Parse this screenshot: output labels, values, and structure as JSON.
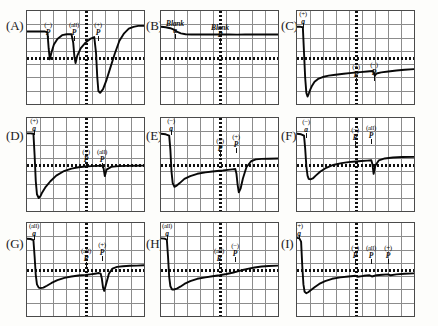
{
  "figure": {
    "title": "",
    "panel_count": 9,
    "grid_rows": 3,
    "grid_cols": 3
  },
  "chart_data": {
    "type": "line",
    "title": "",
    "xlabel": "",
    "ylabel": "",
    "grid": true,
    "legend_position": "none",
    "axis_note": "Each panel is an oscilloscope-style recording with a 9x7 graticule, a dotted horizontal baseline at mid-height and a dotted vertical marker at mid-width.",
    "panels": [
      {
        "id": "A",
        "letter": "(A)",
        "events": [
          {
            "label_top": "(−)",
            "label_bottom": "P",
            "x_frac": 0.18,
            "y_frac": 0.12,
            "kind": "pulse-down"
          },
          {
            "label_top": "(all)",
            "label_bottom": "P",
            "x_frac": 0.4,
            "y_frac": 0.12,
            "kind": "pulse-down"
          },
          {
            "label_top": "(+)",
            "label_bottom": "P",
            "x_frac": 0.61,
            "y_frac": 0.12,
            "kind": "large-deflection"
          }
        ],
        "x": [
          0.0,
          0.05,
          0.1,
          0.15,
          0.175,
          0.185,
          0.195,
          0.21,
          0.23,
          0.26,
          0.3,
          0.34,
          0.38,
          0.395,
          0.405,
          0.415,
          0.43,
          0.46,
          0.5,
          0.54,
          0.575,
          0.59,
          0.6,
          0.61,
          0.625,
          0.65,
          0.68,
          0.71,
          0.75,
          0.79,
          0.83,
          0.87,
          0.91,
          0.95,
          1.0
        ],
        "y": [
          0.22,
          0.22,
          0.22,
          0.22,
          0.23,
          0.4,
          0.52,
          0.44,
          0.36,
          0.3,
          0.26,
          0.25,
          0.25,
          0.34,
          0.49,
          0.56,
          0.48,
          0.4,
          0.34,
          0.3,
          0.28,
          0.45,
          0.7,
          0.86,
          0.88,
          0.84,
          0.74,
          0.62,
          0.46,
          0.32,
          0.24,
          0.19,
          0.17,
          0.16,
          0.16
        ],
        "baseline_frac": 0.5
      },
      {
        "id": "B",
        "letter": "(B)",
        "events": [
          {
            "label_top": "Blank",
            "label_bottom": "a",
            "x_frac": 0.12,
            "y_frac": 0.1,
            "kind": "blank"
          },
          {
            "label_top": "Blank",
            "label_bottom": "P",
            "x_frac": 0.5,
            "y_frac": 0.14,
            "kind": "blank"
          }
        ],
        "x": [
          0.0,
          0.04,
          0.08,
          0.11,
          0.14,
          0.17,
          0.21,
          0.26,
          0.33,
          0.41,
          0.5,
          0.58,
          0.65,
          0.72,
          0.79,
          0.86,
          0.93,
          1.0
        ],
        "y": [
          0.17,
          0.175,
          0.185,
          0.2,
          0.225,
          0.24,
          0.25,
          0.252,
          0.253,
          0.252,
          0.253,
          0.252,
          0.254,
          0.252,
          0.253,
          0.252,
          0.253,
          0.252
        ],
        "baseline_frac": 0.5
      },
      {
        "id": "C",
        "letter": "(C)",
        "events": [
          {
            "label_top": "(+)",
            "label_bottom": "a",
            "x_frac": 0.055,
            "y_frac": -0.02,
            "kind": "pulse-down-large"
          },
          {
            "label_top": "(+)",
            "label_bottom": "P",
            "x_frac": 0.5,
            "y_frac": 0.565,
            "kind": "small-step"
          },
          {
            "label_top": "(−)",
            "label_bottom": "P",
            "x_frac": 0.655,
            "y_frac": 0.545,
            "kind": "small-notch"
          }
        ],
        "x": [
          0.0,
          0.03,
          0.05,
          0.06,
          0.07,
          0.08,
          0.09,
          0.1,
          0.115,
          0.13,
          0.15,
          0.18,
          0.22,
          0.27,
          0.33,
          0.4,
          0.47,
          0.5,
          0.54,
          0.6,
          0.645,
          0.655,
          0.665,
          0.68,
          0.72,
          0.78,
          0.85,
          0.92,
          1.0
        ],
        "y": [
          0.17,
          0.17,
          0.175,
          0.45,
          0.72,
          0.88,
          0.92,
          0.89,
          0.84,
          0.8,
          0.76,
          0.73,
          0.71,
          0.695,
          0.685,
          0.675,
          0.665,
          0.662,
          0.657,
          0.65,
          0.645,
          0.66,
          0.695,
          0.672,
          0.66,
          0.65,
          0.64,
          0.632,
          0.625
        ],
        "baseline_frac": 0.5
      },
      {
        "id": "D",
        "letter": "(D)",
        "events": [
          {
            "label_top": "(+)",
            "label_bottom": "a",
            "x_frac": 0.06,
            "y_frac": -0.02,
            "kind": "pulse-down-large"
          },
          {
            "label_top": "(+)",
            "label_bottom": "P",
            "x_frac": 0.505,
            "y_frac": 0.33,
            "kind": "flat"
          },
          {
            "label_top": "(all)",
            "label_bottom": "P",
            "x_frac": 0.645,
            "y_frac": 0.33,
            "kind": "small-notch"
          }
        ],
        "x": [
          0.0,
          0.03,
          0.055,
          0.065,
          0.075,
          0.085,
          0.1,
          0.115,
          0.13,
          0.16,
          0.2,
          0.25,
          0.31,
          0.38,
          0.44,
          0.5,
          0.55,
          0.6,
          0.645,
          0.655,
          0.665,
          0.68,
          0.72,
          0.78,
          0.85,
          0.92,
          1.0
        ],
        "y": [
          0.165,
          0.165,
          0.17,
          0.4,
          0.68,
          0.82,
          0.86,
          0.84,
          0.8,
          0.74,
          0.68,
          0.62,
          0.575,
          0.545,
          0.53,
          0.522,
          0.518,
          0.515,
          0.512,
          0.545,
          0.625,
          0.555,
          0.525,
          0.518,
          0.515,
          0.513,
          0.512
        ],
        "baseline_frac": 0.5
      },
      {
        "id": "E",
        "letter": "(E)",
        "events": [
          {
            "label_top": "(−)",
            "label_bottom": "a",
            "x_frac": 0.085,
            "y_frac": -0.02,
            "kind": "pulse-down-large"
          },
          {
            "label_top": "(−)",
            "label_bottom": "P",
            "x_frac": 0.505,
            "y_frac": 0.22,
            "kind": "small-step"
          },
          {
            "label_top": "(+)",
            "label_bottom": "P",
            "x_frac": 0.645,
            "y_frac": 0.17,
            "kind": "large-deflection"
          }
        ],
        "x": [
          0.0,
          0.04,
          0.07,
          0.08,
          0.09,
          0.1,
          0.115,
          0.13,
          0.16,
          0.2,
          0.25,
          0.31,
          0.38,
          0.44,
          0.5,
          0.53,
          0.57,
          0.61,
          0.635,
          0.645,
          0.655,
          0.665,
          0.68,
          0.7,
          0.73,
          0.77,
          0.81,
          0.86,
          0.92,
          1.0
        ],
        "y": [
          0.17,
          0.175,
          0.19,
          0.34,
          0.58,
          0.7,
          0.74,
          0.73,
          0.7,
          0.655,
          0.625,
          0.6,
          0.585,
          0.575,
          0.568,
          0.565,
          0.558,
          0.552,
          0.548,
          0.6,
          0.72,
          0.8,
          0.76,
          0.65,
          0.53,
          0.465,
          0.445,
          0.44,
          0.438,
          0.435
        ],
        "baseline_frac": 0.5
      },
      {
        "id": "F",
        "letter": "(F)",
        "events": [
          {
            "label_top": "(−)",
            "label_bottom": "a",
            "x_frac": 0.075,
            "y_frac": 0.01,
            "kind": "pulse-down-large"
          },
          {
            "label_top": "(−)",
            "label_bottom": "P",
            "x_frac": 0.495,
            "y_frac": 0.1,
            "kind": "flat"
          },
          {
            "label_top": "(all)",
            "label_bottom": "P",
            "x_frac": 0.635,
            "y_frac": 0.08,
            "kind": "small-notch"
          }
        ],
        "x": [
          0.0,
          0.035,
          0.06,
          0.07,
          0.08,
          0.09,
          0.1,
          0.115,
          0.135,
          0.16,
          0.2,
          0.25,
          0.31,
          0.38,
          0.44,
          0.5,
          0.55,
          0.6,
          0.635,
          0.645,
          0.655,
          0.67,
          0.7,
          0.75,
          0.82,
          0.9,
          1.0
        ],
        "y": [
          0.17,
          0.175,
          0.19,
          0.33,
          0.52,
          0.62,
          0.655,
          0.66,
          0.65,
          0.62,
          0.575,
          0.535,
          0.505,
          0.485,
          0.475,
          0.468,
          0.463,
          0.458,
          0.455,
          0.5,
          0.6,
          0.51,
          0.455,
          0.435,
          0.425,
          0.42,
          0.418
        ],
        "baseline_frac": 0.5
      },
      {
        "id": "G",
        "letter": "(G)",
        "events": [
          {
            "label_top": "(all)",
            "label_bottom": "a",
            "x_frac": 0.06,
            "y_frac": -0.02,
            "kind": "pulse-down-large"
          },
          {
            "label_top": "(all)",
            "label_bottom": "P",
            "x_frac": 0.5,
            "y_frac": 0.27,
            "kind": "small-step"
          },
          {
            "label_top": "(+)",
            "label_bottom": "P",
            "x_frac": 0.64,
            "y_frac": 0.2,
            "kind": "large-deflection"
          }
        ],
        "x": [
          0.0,
          0.03,
          0.055,
          0.065,
          0.075,
          0.085,
          0.1,
          0.115,
          0.14,
          0.17,
          0.21,
          0.26,
          0.32,
          0.38,
          0.44,
          0.5,
          0.54,
          0.58,
          0.615,
          0.63,
          0.64,
          0.65,
          0.66,
          0.675,
          0.7,
          0.73,
          0.77,
          0.82,
          0.88,
          0.94,
          1.0
        ],
        "y": [
          0.17,
          0.172,
          0.185,
          0.36,
          0.56,
          0.66,
          0.695,
          0.7,
          0.695,
          0.675,
          0.645,
          0.615,
          0.59,
          0.575,
          0.565,
          0.558,
          0.552,
          0.545,
          0.538,
          0.545,
          0.6,
          0.695,
          0.73,
          0.66,
          0.545,
          0.49,
          0.472,
          0.465,
          0.46,
          0.458,
          0.455
        ],
        "baseline_frac": 0.5
      },
      {
        "id": "H",
        "letter": "(H)",
        "events": [
          {
            "label_top": "(all)",
            "label_bottom": "a",
            "x_frac": 0.055,
            "y_frac": -0.02,
            "kind": "pulse-down-large"
          },
          {
            "label_top": "(all)",
            "label_bottom": "P",
            "x_frac": 0.495,
            "y_frac": 0.27,
            "kind": "flat"
          },
          {
            "label_top": "(−)",
            "label_bottom": "P",
            "x_frac": 0.635,
            "y_frac": 0.22,
            "kind": "flat"
          }
        ],
        "x": [
          0.0,
          0.03,
          0.05,
          0.06,
          0.07,
          0.08,
          0.095,
          0.11,
          0.135,
          0.165,
          0.2,
          0.25,
          0.31,
          0.38,
          0.44,
          0.5,
          0.56,
          0.62,
          0.655,
          0.7,
          0.75,
          0.8,
          0.86,
          0.92,
          1.0
        ],
        "y": [
          0.165,
          0.168,
          0.18,
          0.36,
          0.58,
          0.68,
          0.715,
          0.715,
          0.705,
          0.685,
          0.655,
          0.625,
          0.6,
          0.585,
          0.572,
          0.562,
          0.548,
          0.532,
          0.52,
          0.505,
          0.49,
          0.478,
          0.468,
          0.462,
          0.458
        ],
        "baseline_frac": 0.5
      },
      {
        "id": "I",
        "letter": "(I)",
        "events": [
          {
            "label_top": "(+)",
            "label_bottom": "a",
            "x_frac": 0.015,
            "y_frac": -0.02,
            "kind": "pulse-down-large"
          },
          {
            "label_top": "(−)",
            "label_bottom": "P",
            "x_frac": 0.495,
            "y_frac": 0.24,
            "kind": "small-step"
          },
          {
            "label_top": "(all)",
            "label_bottom": "P",
            "x_frac": 0.635,
            "y_frac": 0.24,
            "kind": "small-step"
          },
          {
            "label_top": "(+)",
            "label_bottom": "P",
            "x_frac": 0.775,
            "y_frac": 0.24,
            "kind": "small-step"
          }
        ],
        "x": [
          0.0,
          0.02,
          0.035,
          0.045,
          0.055,
          0.065,
          0.08,
          0.095,
          0.12,
          0.15,
          0.19,
          0.24,
          0.3,
          0.37,
          0.44,
          0.5,
          0.52,
          0.57,
          0.62,
          0.64,
          0.68,
          0.73,
          0.78,
          0.8,
          0.85,
          0.92,
          1.0
        ],
        "y": [
          0.16,
          0.165,
          0.2,
          0.46,
          0.66,
          0.74,
          0.755,
          0.745,
          0.72,
          0.69,
          0.655,
          0.625,
          0.6,
          0.585,
          0.575,
          0.568,
          0.578,
          0.568,
          0.562,
          0.575,
          0.562,
          0.556,
          0.552,
          0.562,
          0.552,
          0.546,
          0.542
        ],
        "baseline_frac": 0.5
      }
    ]
  }
}
